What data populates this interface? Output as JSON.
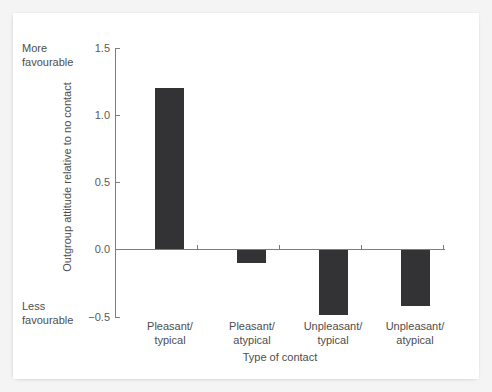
{
  "chart_data": {
    "type": "bar",
    "title": "",
    "subtitle": "",
    "xlabel": "Type of contact",
    "ylabel": "Outgroup attitude relative to no contact",
    "categories": [
      "Pleasant/\ntypical",
      "Pleasant/\natypical",
      "Unpleasant/\ntypical",
      "Unpleasant/\natypical"
    ],
    "values": [
      1.2,
      -0.1,
      -0.49,
      -0.42
    ],
    "ylim": [
      -0.5,
      1.5
    ],
    "yticks": [
      1.5,
      1.0,
      0.5,
      0.0,
      -0.5
    ],
    "ytick_labels": [
      "1.5",
      "1.0",
      "0.5",
      "0.0",
      "−0.5"
    ],
    "grid": false,
    "legend": false,
    "legend_position": "none",
    "bar_color": "#333234",
    "axis_color": "#7d7d7d",
    "text_color": "#4d4d4d",
    "annotations": [
      {
        "name": "more-favourable",
        "text": "More\nfavourable",
        "at_value": 1.5
      },
      {
        "name": "less-favourable",
        "text": "Less\nfavourable",
        "at_value": -0.5
      }
    ]
  },
  "axis": {
    "y_title": "Outgroup attitude relative to no contact",
    "x_title": "Type of contact"
  },
  "anchors": {
    "more": "More\nfavourable",
    "less": "Less\nfavourable"
  }
}
